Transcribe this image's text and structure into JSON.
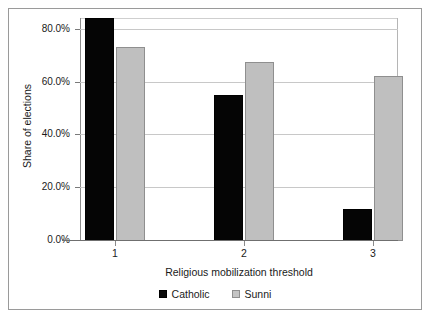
{
  "chart_data": {
    "type": "bar",
    "title": "",
    "subtitle": "",
    "xlabel": "Religious mobilization threshold",
    "ylabel": "Share of elections",
    "categories": [
      "1",
      "2",
      "3"
    ],
    "series": [
      {
        "name": "Catholic",
        "color": "#050505",
        "values": [
          84.0,
          55.0,
          11.8
        ]
      },
      {
        "name": "Sunni",
        "color": "#bfbfbf",
        "values": [
          73.0,
          67.5,
          62.2
        ]
      }
    ],
    "ylim": [
      0,
      90
    ],
    "yticks": [
      0,
      20,
      40,
      60,
      80
    ],
    "ytick_labels": [
      "0.0%",
      "20.0%",
      "40.0%",
      "60.0%",
      "80.0%"
    ],
    "grid": "horizontal",
    "legend_position": "bottom-center",
    "legend_entries": [
      "Catholic",
      "Sunni"
    ]
  },
  "axis": {
    "y_title": "Share of elections",
    "x_title": "Religious mobilization threshold",
    "y_labels": {
      "t80": "80.0%",
      "t60": "60.0%",
      "t40": "40.0%",
      "t20": "20.0%",
      "t0": "0.0%"
    },
    "x_labels": {
      "c1": "1",
      "c2": "2",
      "c3": "3"
    }
  },
  "legend": {
    "catholic_label": "Catholic",
    "sunni_label": "Sunni"
  },
  "colors": {
    "catholic": "#050505",
    "sunni": "#bfbfbf",
    "grid": "#c8c8c8",
    "axis": "#6f6f6f",
    "frame": "#9a9a9a",
    "text": "#1a1a1a"
  }
}
